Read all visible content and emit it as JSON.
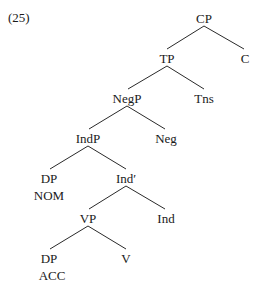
{
  "example_number": "(25)",
  "tree": {
    "nodes": [
      {
        "id": "CP",
        "label": "CP",
        "x": 204,
        "y": 11
      },
      {
        "id": "C",
        "label": "C",
        "x": 245,
        "y": 51
      },
      {
        "id": "TP",
        "label": "TP",
        "x": 167,
        "y": 51
      },
      {
        "id": "Tns",
        "label": "Tns",
        "x": 204,
        "y": 91
      },
      {
        "id": "NegP",
        "label": "NegP",
        "x": 127,
        "y": 91
      },
      {
        "id": "Neg",
        "label": "Neg",
        "x": 166,
        "y": 131
      },
      {
        "id": "IndP",
        "label": "IndP",
        "x": 88,
        "y": 131
      },
      {
        "id": "DP1",
        "label": "DP",
        "x": 49,
        "y": 171
      },
      {
        "id": "NOM",
        "label": "NOM",
        "x": 49,
        "y": 188
      },
      {
        "id": "IndBar",
        "label": "Ind′",
        "x": 126,
        "y": 171
      },
      {
        "id": "VP",
        "label": "VP",
        "x": 88,
        "y": 211
      },
      {
        "id": "Ind",
        "label": "Ind",
        "x": 166,
        "y": 211
      },
      {
        "id": "DP2",
        "label": "DP",
        "x": 49,
        "y": 251
      },
      {
        "id": "ACC",
        "label": "ACC",
        "x": 52,
        "y": 268
      },
      {
        "id": "V",
        "label": "V",
        "x": 126,
        "y": 251
      }
    ],
    "edges": [
      [
        "CP",
        "TP"
      ],
      [
        "CP",
        "C"
      ],
      [
        "TP",
        "NegP"
      ],
      [
        "TP",
        "Tns"
      ],
      [
        "NegP",
        "IndP"
      ],
      [
        "NegP",
        "Neg"
      ],
      [
        "IndP",
        "DP1"
      ],
      [
        "IndP",
        "IndBar"
      ],
      [
        "IndBar",
        "VP"
      ],
      [
        "IndBar",
        "Ind"
      ],
      [
        "VP",
        "DP2"
      ],
      [
        "VP",
        "V"
      ]
    ]
  },
  "labels": {
    "ex": "(25)",
    "CP": "CP",
    "C": "C",
    "TP": "TP",
    "Tns": "Tns",
    "NegP": "NegP",
    "Neg": "Neg",
    "IndP": "IndP",
    "DP1": "DP",
    "NOM": "NOM",
    "IndBar": "Ind′",
    "VP": "VP",
    "Ind": "Ind",
    "DP2": "DP",
    "ACC": "ACC",
    "V": "V"
  }
}
